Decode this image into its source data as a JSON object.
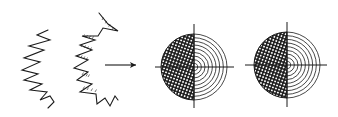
{
  "figure": {
    "width": 338,
    "height": 117,
    "background": "#ffffff",
    "ink_color": "#1a1a1a",
    "zigzag_left": {
      "points": [
        [
          48,
          30
        ],
        [
          37,
          35
        ],
        [
          50,
          40
        ],
        [
          29,
          46
        ],
        [
          44,
          50
        ],
        [
          24,
          58
        ],
        [
          40,
          62
        ],
        [
          22,
          70
        ],
        [
          38,
          74
        ],
        [
          24,
          80
        ],
        [
          42,
          84
        ],
        [
          30,
          90
        ],
        [
          47,
          92
        ],
        [
          40,
          100
        ],
        [
          50,
          96
        ],
        [
          54,
          102
        ],
        [
          48,
          108
        ]
      ],
      "hatched": false
    },
    "zigzag_right": {
      "points": [
        [
          99,
          13
        ],
        [
          108,
          24
        ],
        [
          118,
          31
        ],
        [
          103,
          28
        ],
        [
          98,
          36
        ],
        [
          82,
          36
        ],
        [
          95,
          40
        ],
        [
          80,
          45
        ],
        [
          92,
          50
        ],
        [
          76,
          56
        ],
        [
          88,
          60
        ],
        [
          74,
          68
        ],
        [
          88,
          72
        ],
        [
          77,
          80
        ],
        [
          92,
          84
        ],
        [
          80,
          92
        ],
        [
          96,
          94
        ],
        [
          97,
          104
        ],
        [
          105,
          98
        ],
        [
          110,
          106
        ],
        [
          115,
          96
        ],
        [
          118,
          100
        ]
      ],
      "hatch_segments": [
        [
          [
            102,
            20
          ],
          [
            112,
            30
          ]
        ],
        [
          [
            83,
            37
          ],
          [
            92,
            39
          ]
        ],
        [
          [
            81,
            47
          ],
          [
            90,
            50
          ]
        ],
        [
          [
            78,
            57
          ],
          [
            86,
            60
          ]
        ],
        [
          [
            82,
            75
          ],
          [
            88,
            77
          ]
        ],
        [
          [
            83,
            89
          ],
          [
            95,
            92
          ]
        ]
      ]
    },
    "arrow": {
      "x1": 105,
      "y1": 65,
      "x2": 136,
      "y2": 65,
      "head_size": 6
    },
    "targets": [
      {
        "name": "target-1",
        "cx": 194,
        "cy": 67,
        "r": 33,
        "rings": 9,
        "cross": {
          "h_x1": 155,
          "h_x2": 234,
          "v_y1": 24,
          "v_y2": 108
        }
      },
      {
        "name": "target-2",
        "cx": 287,
        "cy": 65,
        "r": 33,
        "rings": 9,
        "cross": {
          "h_x1": 245,
          "h_x2": 327,
          "v_y1": 22,
          "v_y2": 107
        }
      }
    ]
  }
}
